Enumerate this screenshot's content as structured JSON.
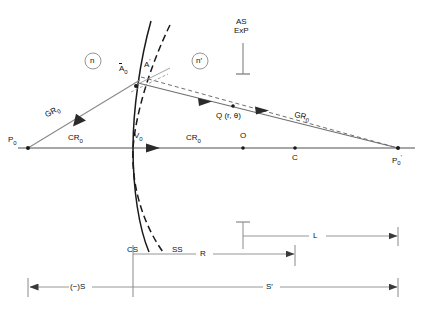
{
  "figure": {
    "type": "optical-ray-diagram",
    "title": "",
    "background": "#ffffff",
    "line_color": "#6e6e6e",
    "text_color": "#111111",
    "width": 423,
    "height": 312
  },
  "labels": {
    "media_left": "n",
    "media_right": "n′",
    "stop_line1": "AS",
    "stop_line2": "ExP",
    "object_point": "P",
    "object_point_sub": "0",
    "image_point": "P",
    "image_point_sub": "0",
    "image_point_prime": "′",
    "vertex": "V",
    "vertex_sub": "0",
    "origin": "O",
    "center": "C",
    "aperture_point": "A",
    "aperture_point_sub": "0",
    "aperture_point_prime": "A",
    "aperture_point_prime_mark": "′",
    "query_point": "Q (r, θ)",
    "general_ray_left": "GR",
    "general_ray_left_sub": "0",
    "general_ray_right": "GR",
    "general_ray_right_sub": "0",
    "chief_ray_left": "CR",
    "chief_ray_left_sub": "0",
    "chief_ray_right": "CR",
    "chief_ray_right_sub": "0",
    "surface_cs": "CS",
    "surface_ss": "SS",
    "dim_L": "L",
    "dim_R": "R",
    "dim_S_neg": "(−)S",
    "dim_S_prime": "S′"
  },
  "geometry": {
    "axis_y": 148,
    "axis_x_start": 18,
    "axis_x_end": 415,
    "vertex_x": 133,
    "object_x": 28,
    "image_x": 398,
    "origin_x": 243,
    "center_x": 295,
    "aperture_y": 77,
    "stop_x": 243,
    "dim_L_y": 236,
    "dim_R_y": 254,
    "dim_S_y": 287
  }
}
